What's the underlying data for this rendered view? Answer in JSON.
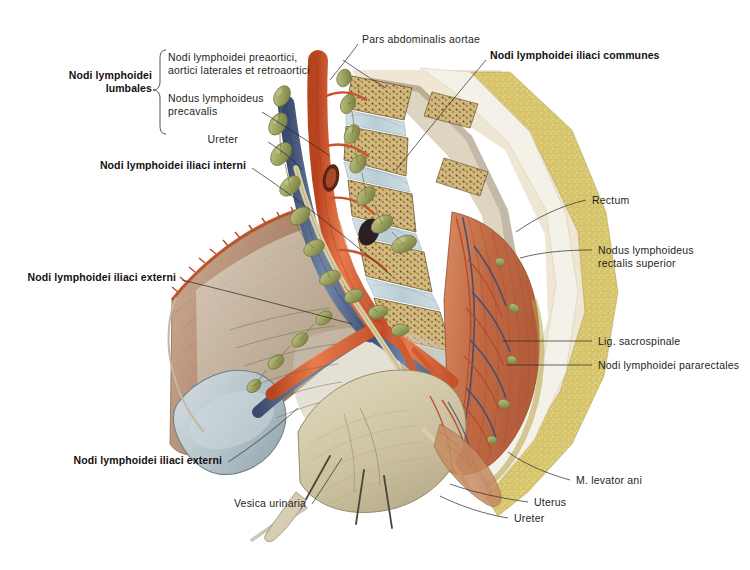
{
  "figure": {
    "background_color": "#ffffff",
    "leader_color": "#2b2724"
  },
  "palette": {
    "artery": "#d4582f",
    "artery_light": "#e8774a",
    "vein": "#4a5f86",
    "vein_light": "#6b7fa3",
    "lymph_node": "#9aa05c",
    "lymph_node_light": "#b4b977",
    "lymph_vessel": "#6d7a3a",
    "bone": "#c9ab6a",
    "bone_light": "#ddc893",
    "disc": "#c3d4dc",
    "muscle": "#c4704f",
    "muscle_light": "#d98f6b",
    "fascia": "#cfc3b2",
    "uterus": "#cfc5a8",
    "fat": "#d8c96a",
    "cut_bone": "#bcc9cf",
    "nerve": "#d8cf8a",
    "outline": "#6b5a47"
  },
  "labels": {
    "group_bracket_title": "Nodi lymphoidei\nlumbales",
    "group_items": [
      {
        "id": "preaortici",
        "text": "Nodi lymphoidei preaortici,\naortici laterales et retroaortici",
        "bold": false
      },
      {
        "id": "precavalis",
        "text": "Nodus lymphoideus\nprecavalis",
        "bold": false
      }
    ],
    "left": [
      {
        "id": "ureter-top",
        "text": "Ureter",
        "bold": false
      },
      {
        "id": "iliaci-interni",
        "text": "Nodi lymphoidei iliaci interni",
        "bold": true
      },
      {
        "id": "iliaci-externi-upper",
        "text": "Nodi lymphoidei iliaci externi",
        "bold": true
      },
      {
        "id": "iliaci-externi-lower",
        "text": "Nodi lymphoidei iliaci externi",
        "bold": true
      },
      {
        "id": "vesica-urinaria",
        "text": "Vesica urinaria",
        "bold": false
      }
    ],
    "top": [
      {
        "id": "pars-abdominalis-aortae",
        "text": "Pars abdominalis aortae",
        "bold": false
      },
      {
        "id": "iliaci-communes",
        "text": "Nodi lymphoidei iliaci communes",
        "bold": true
      }
    ],
    "right": [
      {
        "id": "rectum",
        "text": "Rectum",
        "bold": false
      },
      {
        "id": "nodus-rectalis-superior",
        "text": "Nodus lymphoideus\nrectalis superior",
        "bold": false
      },
      {
        "id": "lig-sacrospinale",
        "text": "Lig. sacrospinale",
        "bold": false
      },
      {
        "id": "pararectales",
        "text": "Nodi lymphoidei pararectales",
        "bold": false
      },
      {
        "id": "levator-ani",
        "text": "M. levator ani",
        "bold": false
      },
      {
        "id": "uterus",
        "text": "Uterus",
        "bold": false
      },
      {
        "id": "ureter-bottom",
        "text": "Ureter",
        "bold": false
      }
    ]
  }
}
